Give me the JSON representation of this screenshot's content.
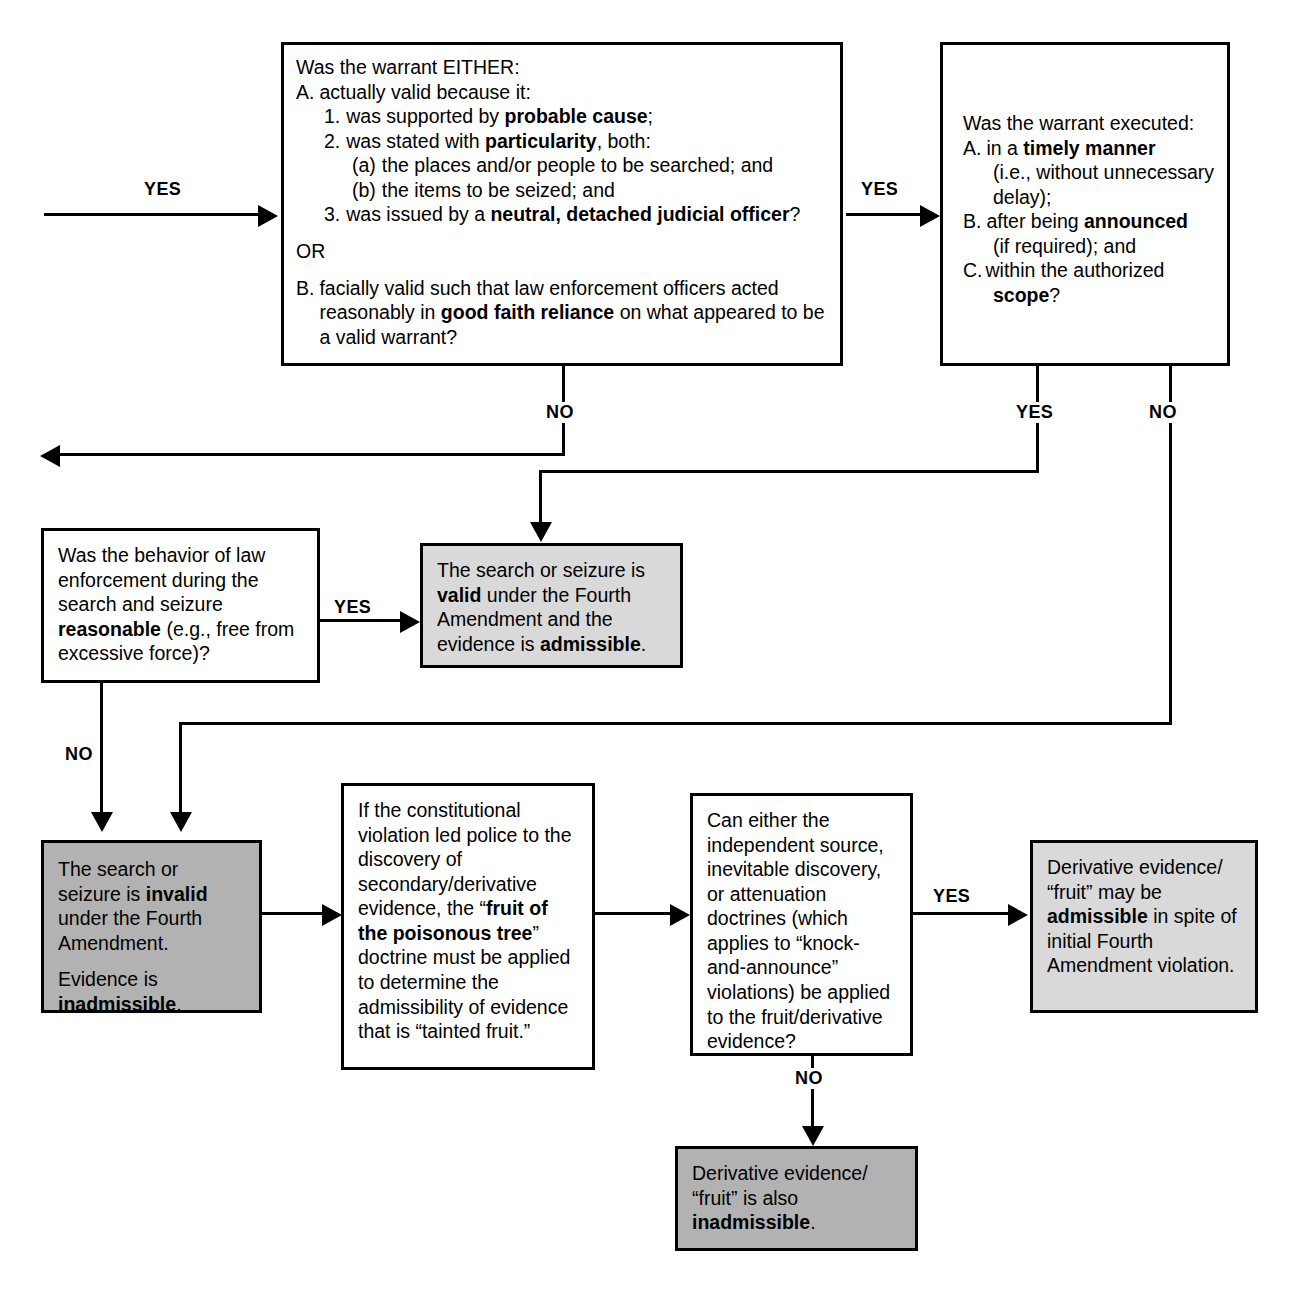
{
  "diagram": {
    "colors": {
      "line": "#000000",
      "box_border": "#000000",
      "shadow": "#8d8d8d",
      "fill_white": "#ffffff",
      "fill_light_gray": "#d9d9d9",
      "fill_dark_gray": "#b2b2b2"
    }
  },
  "edge_labels": {
    "entry_yes": "YES",
    "warrant_valid_yes": "YES",
    "warrant_valid_no": "NO",
    "execution_yes": "YES",
    "execution_no": "NO",
    "behavior_yes": "YES",
    "behavior_no": "NO",
    "doctrines_yes": "YES",
    "doctrines_no": "NO"
  },
  "nodes": {
    "warrant_validity": {
      "id": "warrant-validity-question",
      "lead": "Was the warrant EITHER:",
      "a_marker": "A.",
      "a_text": "actually valid because it:",
      "item1_marker": "1.",
      "item1_pre": "was supported by ",
      "item1_bold": "probable cause",
      "item1_post": ";",
      "item2_marker": "2.",
      "item2_pre": "was stated with ",
      "item2_bold": "particularity",
      "item2_post": ", both:",
      "item2a_marker": "(a)",
      "item2a_text": "the places and/or people to be searched; and",
      "item2b_marker": "(b)",
      "item2b_text": "the items to be seized; and",
      "item3_marker": "3.",
      "item3_pre": "was issued by a ",
      "item3_bold": "neutral, detached judicial officer",
      "item3_post": "?",
      "or_text": "OR",
      "b_marker": "B.",
      "b_pre": "facially valid such that law enforcement officers acted reasonably in ",
      "b_bold": "good faith reliance",
      "b_post": " on what appeared to be a valid warrant?"
    },
    "warrant_execution": {
      "id": "warrant-execution-question",
      "lead": "Was the warrant executed:",
      "a_marker": "A.",
      "a_pre": "in a ",
      "a_bold": "timely manner",
      "a_post": "",
      "a_sub": "(i.e., without unnecessary delay);",
      "b_marker": "B.",
      "b_pre": "after being ",
      "b_bold": "announced",
      "b_post": "",
      "b_sub": "(if required); and",
      "c_marker": "C.",
      "c_pre": "within the authorized ",
      "c_bold": "scope",
      "c_post": "?"
    },
    "behavior_reasonable": {
      "id": "behavior-reasonable-question",
      "pre": "Was the behavior of law enforcement during the search and seizure ",
      "bold": "reasonable",
      "post": " (e.g., free from excessive force)?"
    },
    "search_valid": {
      "id": "search-valid-outcome",
      "pre": "The search or seizure is ",
      "bold1": "valid",
      "mid": " under the Fourth Amendment and the evidence is ",
      "bold2": "admissible",
      "post": "."
    },
    "search_invalid": {
      "id": "search-invalid-outcome",
      "p1_pre": "The search or seizure is ",
      "p1_bold": "invalid",
      "p1_post": " under the Fourth Amendment.",
      "p2_pre": "Evidence is ",
      "p2_bold": "inadmissible",
      "p2_post": "."
    },
    "fruit_doctrine": {
      "id": "fruit-of-poisonous-tree-step",
      "pre": "If the constitutional violation led police to the discovery of secondary/derivative evidence, the “",
      "bold": "fruit of the poisonous tree",
      "post": "” doctrine must be applied to determine the admissibility of evidence that is “tainted fruit.”"
    },
    "doctrines_question": {
      "id": "exception-doctrines-question",
      "text": "Can either the independent source, inevitable discovery, or attenuation doctrines (which applies to “knock-and-announce” violations) be applied to the fruit/derivative evidence?"
    },
    "derivative_admissible": {
      "id": "derivative-admissible-outcome",
      "pre": "Derivative evidence/ “fruit” may be ",
      "bold": "admissible",
      "post": " in spite of initial Fourth Amendment violation."
    },
    "derivative_inadmissible": {
      "id": "derivative-inadmissible-outcome",
      "pre": "Derivative evidence/ “fruit” is also ",
      "bold": "inadmissible",
      "post": "."
    }
  }
}
